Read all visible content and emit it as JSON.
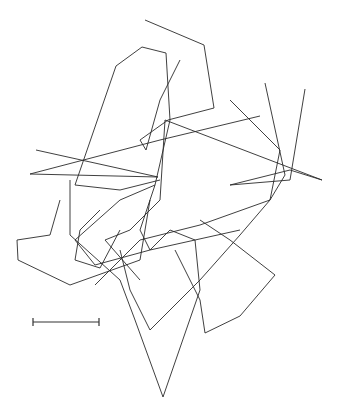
{
  "figure": {
    "type": "overlapping-polygon-traces",
    "background": "#ffffff",
    "stroke_color": "#2a2a2a",
    "traces": [
      [
        [
          145,
          20
        ],
        [
          204,
          45
        ],
        [
          214,
          108
        ],
        [
          168,
          120
        ],
        [
          140,
          140
        ],
        [
          146,
          150
        ],
        [
          160,
          100
        ],
        [
          180,
          60
        ]
      ],
      [
        [
          142,
          47
        ],
        [
          166,
          53
        ],
        [
          170,
          120
        ],
        [
          155,
          185
        ],
        [
          140,
          230
        ],
        [
          150,
          250
        ],
        [
          170,
          230
        ]
      ],
      [
        [
          142,
          47
        ],
        [
          116,
          66
        ],
        [
          75,
          185
        ],
        [
          120,
          190
        ],
        [
          160,
          180
        ]
      ],
      [
        [
          36,
          150
        ],
        [
          158,
          177
        ],
        [
          30,
          174
        ],
        [
          160,
          140
        ],
        [
          260,
          116
        ]
      ],
      [
        [
          305,
          89
        ],
        [
          290,
          180
        ],
        [
          230,
          185
        ],
        [
          290,
          170
        ],
        [
          322,
          180
        ],
        [
          165,
          120
        ]
      ],
      [
        [
          265,
          83
        ],
        [
          285,
          175
        ],
        [
          270,
          200
        ],
        [
          240,
          235
        ],
        [
          200,
          280
        ],
        [
          150,
          330
        ],
        [
          130,
          290
        ],
        [
          120,
          250
        ]
      ],
      [
        [
          60,
          200
        ],
        [
          50,
          235
        ],
        [
          17,
          240
        ],
        [
          18,
          260
        ],
        [
          70,
          285
        ],
        [
          140,
          260
        ],
        [
          150,
          200
        ]
      ],
      [
        [
          100,
          210
        ],
        [
          80,
          230
        ],
        [
          75,
          260
        ],
        [
          100,
          268
        ],
        [
          120,
          230
        ]
      ],
      [
        [
          165,
          120
        ],
        [
          160,
          200
        ],
        [
          130,
          230
        ],
        [
          105,
          240
        ],
        [
          140,
          280
        ]
      ],
      [
        [
          70,
          180
        ],
        [
          70,
          235
        ],
        [
          120,
          280
        ],
        [
          135,
          320
        ],
        [
          163,
          397
        ],
        [
          200,
          290
        ],
        [
          195,
          240
        ],
        [
          170,
          230
        ]
      ],
      [
        [
          175,
          250
        ],
        [
          200,
          300
        ],
        [
          205,
          333
        ],
        [
          240,
          316
        ],
        [
          275,
          275
        ],
        [
          230,
          240
        ],
        [
          200,
          220
        ]
      ],
      [
        [
          95,
          285
        ],
        [
          140,
          240
        ],
        [
          200,
          225
        ],
        [
          270,
          200
        ],
        [
          280,
          150
        ],
        [
          230,
          100
        ]
      ],
      [
        [
          155,
          185
        ],
        [
          120,
          200
        ],
        [
          75,
          240
        ],
        [
          95,
          265
        ],
        [
          150,
          250
        ],
        [
          240,
          230
        ]
      ]
    ],
    "scale_bar": {
      "x1": 33,
      "x2": 99,
      "y": 322
    }
  }
}
